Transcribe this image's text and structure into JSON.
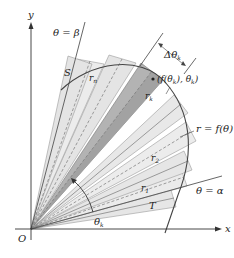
{
  "figure": {
    "type": "polar area approximation diagram",
    "origin_label": "O",
    "x_axis_label": "x",
    "y_axis_label": "y",
    "ray_alpha_label": "θ = α",
    "ray_beta_label": "θ = β",
    "curve_label": "r = f(θ)",
    "point_S_label": "S",
    "point_T_label": "T",
    "rn_label": "r",
    "rn_sub": "n",
    "rk_label": "r",
    "rk_sub": "k",
    "r1_label": "r",
    "r1_sub": "1",
    "r2_label": "r",
    "r2_sub": "2",
    "delta_theta_label": "Δθ",
    "delta_theta_sub": "k",
    "point_label": "(f(θ",
    "point_label_sub": "k",
    "point_label_tail": "), θ",
    "point_label_sub2": "k",
    "point_label_end": ")",
    "theta_k_label": "θ",
    "theta_k_sub": "k"
  },
  "colors": {
    "sector_light": "#e3e3e3",
    "sector_lighter": "#ececec",
    "sector_dark": "#a9a9a9",
    "sector_dark_inner": "#bdbdbd",
    "line": "#555555",
    "curve": "#444444",
    "axis": "#333333"
  }
}
